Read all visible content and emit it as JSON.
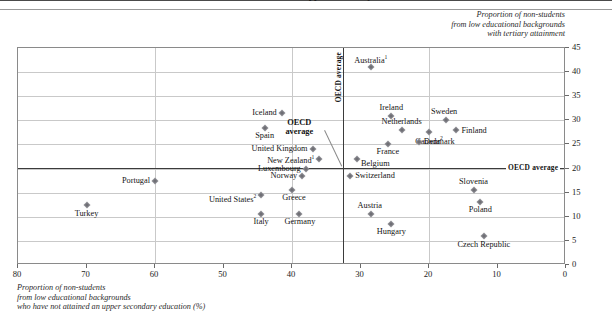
{
  "title": "who have not attained an upper secondary education",
  "axis_caption_y": [
    "Proportion of non-students",
    "from low educational backgrounds",
    "with tertiary attainment"
  ],
  "axis_caption_x": [
    "Proportion of non-students",
    "from low educational backgrounds",
    "who have not attained an upper secondary education (%)"
  ],
  "labels": {
    "oecd_average_vertical": "OECD average",
    "oecd_average_horizontal": "OECD average",
    "oecd_average_callout_line1": "OECD",
    "oecd_average_callout_line2": "average"
  },
  "colors": {
    "marker": "#8d8d92",
    "average_line": "#3b3b3b",
    "grid": "#c9c9c9",
    "frame": "#8a8a8a"
  },
  "chart_data": {
    "type": "scatter",
    "title": "who have not attained an upper secondary education",
    "xlabel": "Proportion of non-students from low educational backgrounds who have not attained an upper secondary education (%)",
    "ylabel": "Proportion of non-students from low educational backgrounds with tertiary attainment",
    "xlim": [
      80,
      0
    ],
    "ylim": [
      0,
      45
    ],
    "x_reversed": true,
    "xticks": [
      80,
      70,
      60,
      50,
      40,
      30,
      20,
      10,
      0
    ],
    "yticks": [
      0,
      5,
      10,
      15,
      20,
      25,
      30,
      35,
      40,
      45
    ],
    "grid": true,
    "legend": "none",
    "oecd_average_x": 32.5,
    "oecd_average_y": 20.2,
    "points": [
      {
        "name": "Australia",
        "sup": "1",
        "x": 28.5,
        "y": 41.0,
        "lx": "c",
        "dx": 0,
        "dy": -8
      },
      {
        "name": "Iceland",
        "sup": "",
        "x": 41.5,
        "y": 31.5,
        "lx": "r",
        "dx": -5,
        "dy": 0
      },
      {
        "name": "Ireland",
        "sup": "",
        "x": 25.5,
        "y": 31.0,
        "lx": "c",
        "dx": 0,
        "dy": -8
      },
      {
        "name": "Sweden",
        "sup": "",
        "x": 17.5,
        "y": 30.0,
        "lx": "c",
        "dx": -2,
        "dy": -8
      },
      {
        "name": "Netherlands",
        "sup": "",
        "x": 24.0,
        "y": 28.0,
        "lx": "c",
        "dx": 0,
        "dy": -8
      },
      {
        "name": "Spain",
        "sup": "",
        "x": 44.0,
        "y": 28.5,
        "lx": "c",
        "dx": 0,
        "dy": 8
      },
      {
        "name": "Finland",
        "sup": "",
        "x": 16.0,
        "y": 28.0,
        "lx": "l",
        "dx": 5,
        "dy": 1
      },
      {
        "name": "Canada",
        "sup": "2",
        "x": 20.0,
        "y": 27.5,
        "lx": "c",
        "dx": 0,
        "dy": 8
      },
      {
        "name": "Denmark",
        "sup": "",
        "x": 21.5,
        "y": 25.5,
        "lx": "l",
        "dx": 5,
        "dy": 0
      },
      {
        "name": "France",
        "sup": "",
        "x": 26.0,
        "y": 25.0,
        "lx": "c",
        "dx": 0,
        "dy": 8
      },
      {
        "name": "United Kingdom",
        "sup": "",
        "x": 37.0,
        "y": 24.0,
        "lx": "r",
        "dx": -5,
        "dy": 0
      },
      {
        "name": "New Zealand",
        "sup": "1",
        "x": 36.0,
        "y": 22.0,
        "lx": "r",
        "dx": -5,
        "dy": 0
      },
      {
        "name": "Belgium",
        "sup": "",
        "x": 30.5,
        "y": 22.0,
        "lx": "l",
        "dx": 4,
        "dy": 5
      },
      {
        "name": "Luxembourg",
        "sup": "",
        "x": 38.0,
        "y": 20.0,
        "lx": "r",
        "dx": -5,
        "dy": 0
      },
      {
        "name": "Switzerland",
        "sup": "",
        "x": 31.5,
        "y": 18.5,
        "lx": "l",
        "dx": 5,
        "dy": 0
      },
      {
        "name": "Norway",
        "sup": "",
        "x": 38.5,
        "y": 18.5,
        "lx": "r",
        "dx": -5,
        "dy": 0
      },
      {
        "name": "Portugal",
        "sup": "",
        "x": 60.0,
        "y": 17.5,
        "lx": "r",
        "dx": -5,
        "dy": 0
      },
      {
        "name": "Slovenia",
        "sup": "",
        "x": 13.5,
        "y": 15.5,
        "lx": "c",
        "dx": 0,
        "dy": -8
      },
      {
        "name": "Greece",
        "sup": "",
        "x": 40.0,
        "y": 15.5,
        "lx": "c",
        "dx": 2,
        "dy": 8
      },
      {
        "name": "United States",
        "sup": "2",
        "x": 44.5,
        "y": 14.5,
        "lx": "r",
        "dx": -5,
        "dy": 3
      },
      {
        "name": "Poland",
        "sup": "",
        "x": 12.5,
        "y": 13.0,
        "lx": "c",
        "dx": 0,
        "dy": 8
      },
      {
        "name": "Turkey",
        "sup": "",
        "x": 70.0,
        "y": 12.5,
        "lx": "c",
        "dx": 0,
        "dy": 9
      },
      {
        "name": "Austria",
        "sup": "",
        "x": 28.5,
        "y": 10.5,
        "lx": "c",
        "dx": -1,
        "dy": -8
      },
      {
        "name": "Germany",
        "sup": "",
        "x": 39.0,
        "y": 10.5,
        "lx": "c",
        "dx": 1,
        "dy": 8
      },
      {
        "name": "Italy",
        "sup": "",
        "x": 44.5,
        "y": 10.5,
        "lx": "c",
        "dx": 0,
        "dy": 8
      },
      {
        "name": "Hungary",
        "sup": "",
        "x": 25.5,
        "y": 8.5,
        "lx": "c",
        "dx": 0,
        "dy": 8
      },
      {
        "name": "Czech Republic",
        "sup": "",
        "x": 12.0,
        "y": 6.0,
        "lx": "c",
        "dx": 0,
        "dy": 9
      }
    ]
  }
}
